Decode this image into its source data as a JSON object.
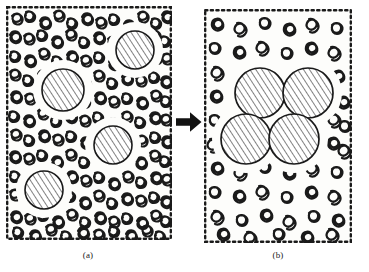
{
  "figure": {
    "type": "schematic-diagram",
    "background_color": "#ffffff",
    "ink_color": "#1a1a1a"
  },
  "panels": [
    {
      "id": "a",
      "caption": "(a)",
      "border_style": "dotted",
      "x": 6,
      "y": 6,
      "width": 166,
      "height": 234,
      "matrix_style": "dense-entangled-chains",
      "particle_state": "dispersed",
      "particle_count": 4,
      "particles": [
        {
          "cx": 57,
          "cy": 84,
          "r": 21
        },
        {
          "cx": 129,
          "cy": 44,
          "r": 19
        },
        {
          "cx": 107,
          "cy": 139,
          "r": 19
        },
        {
          "cx": 38,
          "cy": 184,
          "r": 19
        }
      ],
      "hatch_angle_deg": 33,
      "hatch_spacing": 5
    },
    {
      "id": "b",
      "caption": "(b)",
      "border_style": "dotted",
      "x": 204,
      "y": 9,
      "width": 148,
      "height": 234,
      "matrix_style": "sparse-discrete-coils",
      "particle_state": "aggregated-cluster",
      "particle_count": 4,
      "particles": [
        {
          "cx": 56,
          "cy": 84,
          "r": 25
        },
        {
          "cx": 104,
          "cy": 84,
          "r": 25
        },
        {
          "cx": 42,
          "cy": 130,
          "r": 25
        },
        {
          "cx": 90,
          "cy": 130,
          "r": 25
        }
      ],
      "hatch_angle_deg": 33,
      "hatch_spacing": 5
    }
  ],
  "arrow": {
    "direction": "right",
    "color": "#121212",
    "x": 176,
    "y": 111,
    "width": 26,
    "height": 22
  },
  "captions": {
    "panel_a": "(a)",
    "panel_b": "(b)"
  },
  "colors": {
    "ink": "#1a1a1a",
    "paper": "#ffffff",
    "panel_fill": "#fdfdfb",
    "arrow": "#121212"
  }
}
